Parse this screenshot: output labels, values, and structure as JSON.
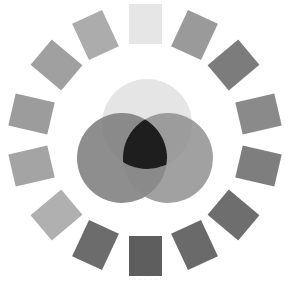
{
  "diagram": {
    "type": "grayscale color wheel with overlapping circles",
    "center": [
      145,
      140
    ],
    "ring_radius": 116,
    "swatch_size": [
      33,
      40
    ],
    "swatches": [
      {
        "angle": 0,
        "color": "#e6e6e6"
      },
      {
        "angle": 25,
        "color": "#9a9a9a"
      },
      {
        "angle": 50,
        "color": "#7c7c7c"
      },
      {
        "angle": 77,
        "color": "#8a8a8a"
      },
      {
        "angle": 103,
        "color": "#7e7e7e"
      },
      {
        "angle": 130,
        "color": "#6e6e6e"
      },
      {
        "angle": 155,
        "color": "#6a6a6a"
      },
      {
        "angle": 180,
        "color": "#5e5e5e"
      },
      {
        "angle": 205,
        "color": "#6c6c6c"
      },
      {
        "angle": 230,
        "color": "#b0b0b0"
      },
      {
        "angle": 257,
        "color": "#a4a4a4"
      },
      {
        "angle": 283,
        "color": "#9c9c9c"
      },
      {
        "angle": 310,
        "color": "#a0a0a0"
      },
      {
        "angle": 335,
        "color": "#acacac"
      }
    ],
    "circles": [
      {
        "name": "top-circle",
        "cx": 147,
        "cy": 124,
        "r": 45,
        "color": "#e2e2e2"
      },
      {
        "name": "left-circle",
        "cx": 122,
        "cy": 158,
        "r": 45,
        "color": "#7a7a7a"
      },
      {
        "name": "right-circle",
        "cx": 168,
        "cy": 158,
        "r": 45,
        "color": "#8a8a8a"
      }
    ],
    "intersection_color": "#1e1e1e"
  },
  "caption": "· · · · ·"
}
